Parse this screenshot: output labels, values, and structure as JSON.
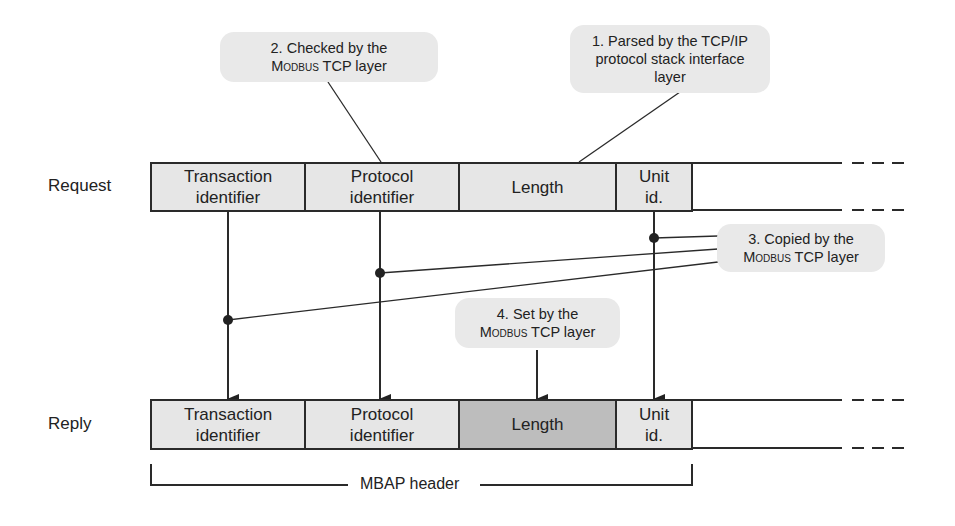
{
  "rows": {
    "request": {
      "label": "Request",
      "fields": [
        {
          "name": "transaction",
          "line1": "Transaction",
          "line2": "identifier"
        },
        {
          "name": "protocol",
          "line1": "Protocol",
          "line2": "identifier"
        },
        {
          "name": "length",
          "line1": "Length",
          "line2": ""
        },
        {
          "name": "unit",
          "line1": "Unit",
          "line2": "id."
        }
      ]
    },
    "reply": {
      "label": "Reply",
      "fields": [
        {
          "name": "transaction",
          "line1": "Transaction",
          "line2": "identifier"
        },
        {
          "name": "protocol",
          "line1": "Protocol",
          "line2": "identifier"
        },
        {
          "name": "length",
          "line1": "Length",
          "line2": "",
          "highlighted": true
        },
        {
          "name": "unit",
          "line1": "Unit",
          "line2": "id."
        }
      ]
    }
  },
  "callouts": {
    "c1": {
      "line1": "1. Parsed by the TCP/IP",
      "line2": "protocol stack interface",
      "line3": "layer"
    },
    "c2": {
      "line1": "2. Checked by the",
      "line2_sc": "Modbus",
      "line2_rest": " TCP layer"
    },
    "c3": {
      "line1": "3. Copied by the",
      "line2_sc": "Modbus",
      "line2_rest": " TCP layer"
    },
    "c4": {
      "line1": "4. Set by the",
      "line2_sc": "Modbus",
      "line2_rest": " TCP layer"
    }
  },
  "bracket": {
    "label": "MBAP header"
  },
  "colors": {
    "cell_fill": "#e6e6e6",
    "cell_fill_highlight": "#bdbdbd",
    "callout_fill": "#e9e9e9",
    "stroke": "#2a2a2a"
  }
}
